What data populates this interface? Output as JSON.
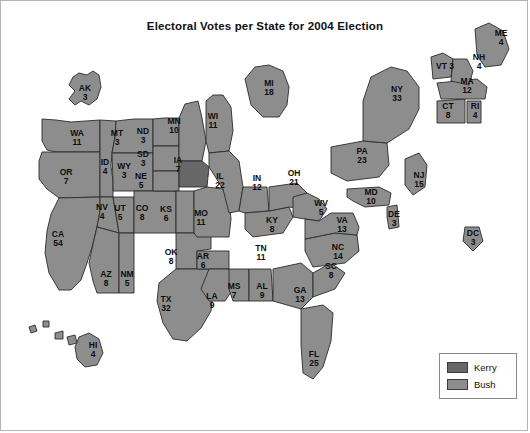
{
  "figure": {
    "title": "Electoral Votes per State for 2004 Election"
  },
  "legend": {
    "items": [
      {
        "label": "Kerry",
        "color": "#676767"
      },
      {
        "label": "Bush",
        "color": "#8d8d8d"
      }
    ]
  },
  "chart_data": {
    "type": "map",
    "title": "Electoral Votes per State for 2004 Election",
    "subtitle": "",
    "value_label": "Electoral Votes",
    "categories": [
      "Kerry",
      "Bush"
    ],
    "category_colors": {
      "Kerry": "#676767",
      "Bush": "#8d8d8d"
    },
    "total_electoral_votes": 538,
    "regions": [
      {
        "abbr": "AK",
        "votes": 3,
        "winner": "Bush",
        "x": 84,
        "y": 92,
        "inset": true
      },
      {
        "abbr": "HI",
        "votes": 4,
        "winner": "Bush",
        "x": 92,
        "y": 349,
        "inset": true
      },
      {
        "abbr": "WA",
        "votes": 11,
        "winner": "Bush",
        "x": 76,
        "y": 137
      },
      {
        "abbr": "OR",
        "votes": 7,
        "winner": "Bush",
        "x": 65,
        "y": 176
      },
      {
        "abbr": "CA",
        "votes": 54,
        "winner": "Bush",
        "x": 57,
        "y": 238
      },
      {
        "abbr": "ID",
        "votes": 4,
        "winner": "Bush",
        "x": 104,
        "y": 166
      },
      {
        "abbr": "NV",
        "votes": 4,
        "winner": "Bush",
        "x": 101,
        "y": 211
      },
      {
        "abbr": "UT",
        "votes": 5,
        "winner": "Bush",
        "x": 119,
        "y": 212
      },
      {
        "abbr": "AZ",
        "votes": 8,
        "winner": "Bush",
        "x": 105,
        "y": 278
      },
      {
        "abbr": "MT",
        "votes": 3,
        "winner": "Bush",
        "x": 116,
        "y": 137
      },
      {
        "abbr": "WY",
        "votes": 3,
        "winner": "Bush",
        "x": 123,
        "y": 170
      },
      {
        "abbr": "CO",
        "votes": 8,
        "winner": "Bush",
        "x": 141,
        "y": 212
      },
      {
        "abbr": "NM",
        "votes": 5,
        "winner": "Bush",
        "x": 126,
        "y": 278
      },
      {
        "abbr": "ND",
        "votes": 3,
        "winner": "Bush",
        "x": 142,
        "y": 135
      },
      {
        "abbr": "SD",
        "votes": 3,
        "winner": "Bush",
        "x": 142,
        "y": 158
      },
      {
        "abbr": "NE",
        "votes": 5,
        "winner": "Bush",
        "x": 140,
        "y": 180
      },
      {
        "abbr": "KS",
        "votes": 6,
        "winner": "Bush",
        "x": 165,
        "y": 213
      },
      {
        "abbr": "OK",
        "votes": 8,
        "winner": "Bush",
        "x": 170,
        "y": 256
      },
      {
        "abbr": "TX",
        "votes": 32,
        "winner": "Bush",
        "x": 165,
        "y": 303
      },
      {
        "abbr": "MN",
        "votes": 10,
        "winner": "Bush",
        "x": 173,
        "y": 125
      },
      {
        "abbr": "IA",
        "votes": 7,
        "winner": "Kerry",
        "x": 177,
        "y": 164
      },
      {
        "abbr": "MO",
        "votes": 11,
        "winner": "Bush",
        "x": 200,
        "y": 217
      },
      {
        "abbr": "AR",
        "votes": 6,
        "winner": "Bush",
        "x": 202,
        "y": 260
      },
      {
        "abbr": "LA",
        "votes": 9,
        "winner": "Bush",
        "x": 211,
        "y": 300
      },
      {
        "abbr": "WI",
        "votes": 11,
        "winner": "Bush",
        "x": 212,
        "y": 120
      },
      {
        "abbr": "IL",
        "votes": 22,
        "winner": "Bush",
        "x": 219,
        "y": 180
      },
      {
        "abbr": "MS",
        "votes": 7,
        "winner": "Bush",
        "x": 233,
        "y": 290
      },
      {
        "abbr": "TN",
        "votes": 11,
        "winner": "Bush",
        "x": 260,
        "y": 252
      },
      {
        "abbr": "AL",
        "votes": 9,
        "winner": "Bush",
        "x": 261,
        "y": 290
      },
      {
        "abbr": "MI",
        "votes": 18,
        "winner": "Bush",
        "x": 268,
        "y": 87
      },
      {
        "abbr": "IN",
        "votes": 12,
        "winner": "Bush",
        "x": 256,
        "y": 182
      },
      {
        "abbr": "KY",
        "votes": 8,
        "winner": "Bush",
        "x": 271,
        "y": 224
      },
      {
        "abbr": "OH",
        "votes": 21,
        "winner": "Bush",
        "x": 293,
        "y": 177
      },
      {
        "abbr": "GA",
        "votes": 13,
        "winner": "Bush",
        "x": 299,
        "y": 294
      },
      {
        "abbr": "FL",
        "votes": 25,
        "winner": "Bush",
        "x": 313,
        "y": 358
      },
      {
        "abbr": "WV",
        "votes": 5,
        "winner": "Bush",
        "x": 320,
        "y": 207
      },
      {
        "abbr": "SC",
        "votes": 8,
        "winner": "Bush",
        "x": 330,
        "y": 270
      },
      {
        "abbr": "NC",
        "votes": 14,
        "winner": "Bush",
        "x": 337,
        "y": 251
      },
      {
        "abbr": "VA",
        "votes": 13,
        "winner": "Bush",
        "x": 341,
        "y": 224
      },
      {
        "abbr": "PA",
        "votes": 23,
        "winner": "Bush",
        "x": 361,
        "y": 155
      },
      {
        "abbr": "MD",
        "votes": 10,
        "winner": "Bush",
        "x": 370,
        "y": 196
      },
      {
        "abbr": "DE",
        "votes": 3,
        "winner": "Bush",
        "x": 393,
        "y": 218
      },
      {
        "abbr": "NY",
        "votes": 33,
        "winner": "Bush",
        "x": 396,
        "y": 93
      },
      {
        "abbr": "NJ",
        "votes": 15,
        "winner": "Bush",
        "x": 418,
        "y": 179
      },
      {
        "abbr": "DC",
        "votes": 3,
        "winner": "Bush",
        "x": 472,
        "y": 237,
        "inset": true
      },
      {
        "abbr": "VT",
        "votes": 3,
        "winner": "Bush",
        "x": 444,
        "y": 65,
        "inline": true
      },
      {
        "abbr": "CT",
        "votes": 8,
        "winner": "Bush",
        "x": 447,
        "y": 110
      },
      {
        "abbr": "RI",
        "votes": 4,
        "winner": "Bush",
        "x": 474,
        "y": 110
      },
      {
        "abbr": "MA",
        "votes": 12,
        "winner": "Bush",
        "x": 466,
        "y": 85
      },
      {
        "abbr": "NH",
        "votes": 4,
        "winner": "Bush",
        "x": 478,
        "y": 61
      },
      {
        "abbr": "ME",
        "votes": 4,
        "winner": "Bush",
        "x": 500,
        "y": 37
      }
    ]
  }
}
